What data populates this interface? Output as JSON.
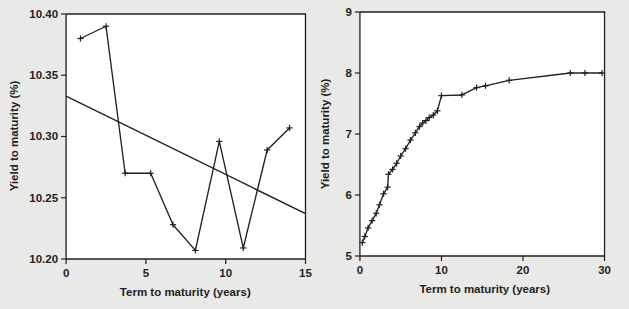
{
  "figure": {
    "background_color": "#e9e9e7",
    "plot_background_color": "#ffffff",
    "ink_color": "#231f20"
  },
  "chart_data": [
    {
      "type": "line",
      "panel": "left",
      "title": "",
      "xlabel": "Term to maturity (years)",
      "ylabel": "Yield to maturity (%)",
      "xlim": [
        0,
        15
      ],
      "ylim": [
        10.2,
        10.4
      ],
      "xticks": [
        0,
        5,
        10,
        15
      ],
      "xticklabels": [
        "0",
        "5",
        "10",
        "15"
      ],
      "yticks": [
        10.2,
        10.25,
        10.3,
        10.35,
        10.4
      ],
      "yticklabels": [
        "10.20",
        "10.25",
        "10.30",
        "10.35",
        "10.40"
      ],
      "grid": false,
      "legend": false,
      "series": [
        {
          "name": "Observed yields",
          "marker": "plus",
          "x": [
            0.9,
            2.5,
            3.7,
            5.3,
            6.7,
            8.1,
            9.6,
            11.1,
            12.6,
            14.0
          ],
          "y": [
            10.38,
            10.39,
            10.27,
            10.27,
            10.228,
            10.207,
            10.296,
            10.209,
            10.289,
            10.307
          ]
        },
        {
          "name": "Fitted trend line",
          "marker": "none",
          "x": [
            0,
            15
          ],
          "y": [
            10.333,
            10.237
          ]
        }
      ]
    },
    {
      "type": "line",
      "panel": "right",
      "title": "",
      "xlabel": "Term to maturity (years)",
      "ylabel": "Yield to maturity (%)",
      "xlim": [
        0,
        30
      ],
      "ylim": [
        5,
        9
      ],
      "xticks": [
        0,
        10,
        20,
        30
      ],
      "xticklabels": [
        "0",
        "10",
        "20",
        "30"
      ],
      "yticks": [
        5,
        6,
        7,
        8,
        9
      ],
      "yticklabels": [
        "5",
        "6",
        "7",
        "8",
        "9"
      ],
      "grid": false,
      "legend": false,
      "series": [
        {
          "name": "Yield curve",
          "marker": "plus",
          "x": [
            0.3,
            0.6,
            1.0,
            1.5,
            2.0,
            2.4,
            2.9,
            3.4,
            3.5,
            4.0,
            4.5,
            5.0,
            5.6,
            6.2,
            6.8,
            7.3,
            7.7,
            8.1,
            8.5,
            9.0,
            9.5,
            10.0,
            12.5,
            14.3,
            15.4,
            18.3,
            25.8,
            27.6,
            29.7
          ],
          "y": [
            5.22,
            5.32,
            5.46,
            5.58,
            5.7,
            5.84,
            6.02,
            6.13,
            6.34,
            6.42,
            6.52,
            6.64,
            6.76,
            6.9,
            7.02,
            7.12,
            7.18,
            7.22,
            7.27,
            7.31,
            7.38,
            7.63,
            7.64,
            7.76,
            7.79,
            7.88,
            8.0,
            8.0,
            8.0
          ]
        }
      ]
    }
  ]
}
